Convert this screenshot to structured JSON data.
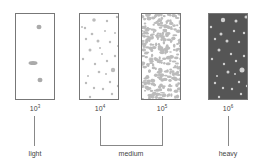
{
  "panels": [
    {
      "id": "p1",
      "exponent_base": "10",
      "exponent": "3",
      "fill": "#ffffff",
      "particle_color": "#aaaaaa",
      "density": "light"
    },
    {
      "id": "p2",
      "exponent_base": "10",
      "exponent": "4",
      "fill": "#ffffff",
      "particle_color": "#bbbbbb",
      "density": "medium"
    },
    {
      "id": "p3",
      "exponent_base": "10",
      "exponent": "5",
      "fill": "#ffffff",
      "particle_color": "#bbbbbb",
      "density": "medium"
    },
    {
      "id": "p4",
      "exponent_base": "10",
      "exponent": "6",
      "fill": "#555555",
      "particle_color": "#cccccc",
      "density": "heavy"
    }
  ],
  "categories": {
    "light": "light",
    "medium": "medium",
    "heavy": "heavy"
  }
}
